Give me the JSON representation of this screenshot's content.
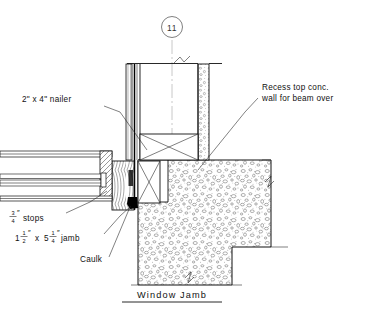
{
  "drawing": {
    "title": "Window Jamb",
    "detail_bubble": {
      "label": "11",
      "name": "detail-reference-bubble"
    },
    "annotations": [
      {
        "id": "nailer",
        "text": "2\" x 4\" nailer",
        "x": 22,
        "y": 102
      },
      {
        "id": "recess",
        "line1": "Recess top conc.",
        "line2": "wall for beam over",
        "x": 262,
        "y": 90
      },
      {
        "id": "stops",
        "whole": "",
        "num": "3",
        "den": "4",
        "inch": "″",
        "suffix": " stops",
        "x": 12,
        "y": 219
      },
      {
        "id": "jamb",
        "whole_a": "1",
        "num_a": "1",
        "den_a": "2",
        "mid": "x",
        "whole_b": "5",
        "num_b": "1",
        "den_b": "4",
        "suffix": " jamb",
        "inch": "″",
        "x": 14,
        "y": 239
      },
      {
        "id": "caulk",
        "text": "Caulk",
        "x": 80,
        "y": 262
      }
    ],
    "materials": {
      "concrete_label": "concrete-stipple-hatch",
      "wood_jamb_label": "wood-grain-hatch",
      "nailer_label": "nailer-x-section",
      "caulk_label": "caulk-bead-solid"
    },
    "colors": {
      "line": "#1a1a1a",
      "heavy_line": "#000000",
      "center_line": "#9a9a9a",
      "hatch": "#3a3a3a",
      "background": "#ffffff"
    }
  }
}
